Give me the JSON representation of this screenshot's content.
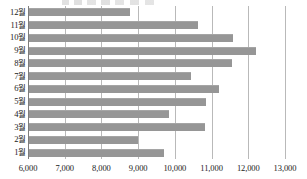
{
  "chart_data": {
    "type": "bar",
    "orientation": "horizontal",
    "title": "",
    "xlabel": "",
    "ylabel": "",
    "categories": [
      "12월",
      "11월",
      "10월",
      "9월",
      "8월",
      "7월",
      "6월",
      "5월",
      "4월",
      "3월",
      "2월",
      "1월"
    ],
    "values": [
      8750,
      10600,
      11550,
      12180,
      11530,
      10420,
      11180,
      10820,
      9800,
      10790,
      8970,
      9670
    ],
    "series": [
      {
        "name": "",
        "values": [
          8750,
          10600,
          11550,
          12180,
          11530,
          10420,
          11180,
          10820,
          9800,
          10790,
          8970,
          9670
        ]
      }
    ],
    "xlim": [
      6000,
      13000
    ],
    "xticks": [
      6000,
      7000,
      8000,
      9000,
      10000,
      11000,
      12000,
      13000
    ],
    "xticklabels": [
      "6,000",
      "7,000",
      "8,000",
      "9,000",
      "10,000",
      "11,000",
      "12,000",
      "13,000"
    ],
    "grid": true,
    "grid_axis": "x",
    "legend": false,
    "bar_color": "#969696",
    "gridline_color": "#b9b9b9",
    "axis_color": "#7d7d7d",
    "background": "#ffffff"
  }
}
